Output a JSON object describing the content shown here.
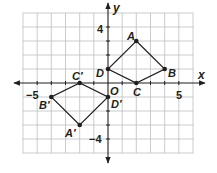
{
  "diagram": {
    "type": "coordinate-plane",
    "axes": {
      "x_label": "x",
      "y_label": "y",
      "x_range": [
        -6,
        6
      ],
      "y_range": [
        -5,
        5
      ],
      "tick_labels": {
        "x_neg": "−5",
        "x_pos": "5",
        "y_pos": "4",
        "y_neg": "−4",
        "origin": "O"
      }
    },
    "grid": {
      "on": true,
      "step": 1,
      "line_color": "#bcbec0"
    },
    "colors": {
      "ink": "#231f20",
      "grid": "#bcbec0",
      "background": "#ffffff"
    },
    "figures": [
      {
        "name": "ABCD",
        "vertices": [
          {
            "label": "A",
            "x": 2,
            "y": 3
          },
          {
            "label": "B",
            "x": 4,
            "y": 1
          },
          {
            "label": "C",
            "x": 2,
            "y": 0
          },
          {
            "label": "D",
            "x": 0,
            "y": 1
          }
        ]
      },
      {
        "name": "A'B'C'D'",
        "vertices": [
          {
            "label": "A′",
            "x": -2,
            "y": -3
          },
          {
            "label": "B′",
            "x": -4,
            "y": -1
          },
          {
            "label": "C′",
            "x": -2,
            "y": 0
          },
          {
            "label": "D′",
            "x": 0,
            "y": -1
          }
        ]
      }
    ]
  }
}
